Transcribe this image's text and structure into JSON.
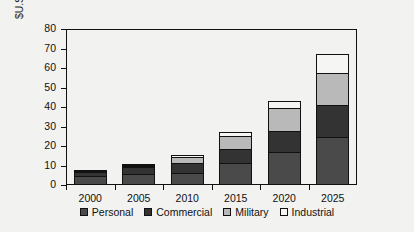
{
  "chart_data": {
    "type": "bar",
    "subtype": "stacked-bar",
    "title": "",
    "xlabel": "",
    "ylabel": "$U.S. billions",
    "categories": [
      "2000",
      "2005",
      "2010",
      "2015",
      "2020",
      "2025"
    ],
    "ylim": [
      0,
      80
    ],
    "yticks": [
      0,
      10,
      20,
      30,
      40,
      50,
      60,
      70,
      80
    ],
    "ytick_labels": [
      "0",
      "10",
      "20",
      "30",
      "40",
      "50",
      "60",
      "70",
      "80"
    ],
    "grid": false,
    "legend_position": "bottom",
    "series": [
      {
        "name": "Personal",
        "color": "#4a4a4a",
        "values": [
          4.2,
          5.2,
          5.6,
          10.8,
          16.2,
          24.3
        ]
      },
      {
        "name": "Commercial",
        "color": "#333333",
        "values": [
          2.2,
          3.5,
          5.0,
          7.2,
          11.0,
          16.2
        ]
      },
      {
        "name": "Military",
        "color": "#b9b9b9",
        "values": [
          0.2,
          0.8,
          3.4,
          6.4,
          11.8,
          16.5
        ]
      },
      {
        "name": "Industrial",
        "color": "#f5f5f3",
        "values": [
          0.6,
          0.8,
          0.7,
          2.2,
          3.5,
          9.5
        ]
      }
    ],
    "totals": [
      7.2,
      10.3,
      14.7,
      26.6,
      42.5,
      66.5
    ],
    "legend_entries": [
      "Personal",
      "Commercial",
      "Military",
      "Industrial"
    ]
  }
}
